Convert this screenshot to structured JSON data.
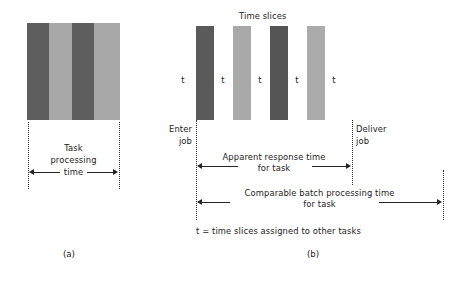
{
  "figure": {
    "panels": [
      {
        "id": "a",
        "label": "(a)",
        "measure": {
          "line1": "Task",
          "line2": "processing",
          "line3": "time"
        },
        "block": {
          "stripes": [
            {
              "color": "#5e5e5e",
              "width": 22
            },
            {
              "color": "#a8a8a8",
              "width": 23
            },
            {
              "color": "#5e5e5e",
              "width": 22
            },
            {
              "color": "#a8a8a8",
              "width": 26
            }
          ]
        }
      },
      {
        "id": "b",
        "label": "(b)",
        "title": "Time slices",
        "bars": [
          {
            "color": "#5a5a5a",
            "left": 196
          },
          {
            "color": "#a9a9a9",
            "left": 233
          },
          {
            "color": "#555555",
            "left": 270
          },
          {
            "color": "#ababab",
            "left": 307
          }
        ],
        "slice_labels": [
          "t",
          "t",
          "t",
          "t",
          "t"
        ],
        "enter_job": {
          "line1": "Enter",
          "line2": "job"
        },
        "deliver_job": {
          "line1": "Deliver",
          "line2": "job"
        },
        "apparent": {
          "line1": "Apparent response time",
          "line2": "for task"
        },
        "comparable": {
          "line1": "Comparable batch processing time",
          "line2": "for task"
        },
        "footnote": "t = time slices assigned to other tasks"
      }
    ]
  },
  "colors": {
    "ink": "#1b1b1b",
    "rule": "#242424",
    "dark_slice": "#5a5a5a",
    "light_slice": "#a9a9a9",
    "background": "#ffffff"
  }
}
